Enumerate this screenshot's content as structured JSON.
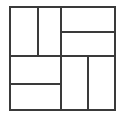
{
  "diagram": {
    "name": "partitioned-square",
    "shape": "square",
    "stroke_color": "#3a3a3a",
    "background_color": "#ffffff",
    "stroke_width": 2,
    "cell_count": 8,
    "bounds": {
      "x": 9,
      "y": 6,
      "width": 107,
      "height": 105
    },
    "dividers": {
      "vertical_main_x": 61,
      "top_left_split_x": 38,
      "bottom_right_split_x": 88,
      "horizontal_main_y": 55,
      "top_right_split_y": 31,
      "bottom_left_split_y": 83
    },
    "cells": [
      {
        "id": "top-left-a",
        "x": 9,
        "y": 6,
        "width": 29,
        "height": 49
      },
      {
        "id": "top-left-b",
        "x": 38,
        "y": 6,
        "width": 23,
        "height": 49
      },
      {
        "id": "top-right-upper",
        "x": 61,
        "y": 6,
        "width": 55,
        "height": 25
      },
      {
        "id": "top-right-lower",
        "x": 61,
        "y": 31,
        "width": 55,
        "height": 24
      },
      {
        "id": "bottom-left-upper",
        "x": 9,
        "y": 55,
        "width": 52,
        "height": 28
      },
      {
        "id": "bottom-left-lower",
        "x": 9,
        "y": 83,
        "width": 52,
        "height": 28
      },
      {
        "id": "bottom-right-left",
        "x": 61,
        "y": 55,
        "width": 27,
        "height": 56
      },
      {
        "id": "bottom-right-right",
        "x": 88,
        "y": 55,
        "width": 28,
        "height": 56
      }
    ]
  }
}
